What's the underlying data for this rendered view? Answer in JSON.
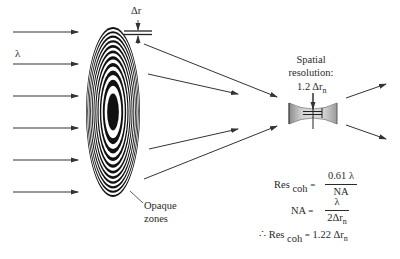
{
  "diagram": {
    "wavelength_label": "λ",
    "delta_r_label": "Δr",
    "opaque_zones_label": [
      "Opaque",
      "zones"
    ],
    "spatial_resolution": {
      "line1": "Spatial",
      "line2": "resolution:",
      "value_prefix": "1.2 Δr",
      "value_sub": "n"
    },
    "formulas": {
      "res_coh": {
        "lhs": "Res",
        "lhs_sub": "coh",
        "eq": "=",
        "numerator": "0.61 λ",
        "denominator": "NA"
      },
      "na": {
        "lhs": "NA",
        "eq": "=",
        "numerator": "λ",
        "denominator_prefix": "2Δr",
        "denominator_sub": "n"
      },
      "result": {
        "therefore": "∴",
        "lhs": "Res",
        "lhs_sub": "coh",
        "eq": "=",
        "rhs_prefix": "1.22 Δr",
        "rhs_sub": "n"
      }
    },
    "zone_plate": {
      "cx": 113,
      "cy": 112,
      "rx_outer": 27,
      "ry_outer": 85,
      "zones": 21,
      "fill_dark": "#111111",
      "fill_light": "#ffffff"
    },
    "colors": {
      "line": "#333333",
      "focus_fill": "#bdbdbd",
      "text": "#2a2a2a"
    },
    "incident_arrows_y": [
      32,
      64,
      96,
      128,
      160,
      192
    ],
    "converging_arrows": [
      {
        "x1": 144,
        "y1": 44,
        "x2": 277,
        "y2": 97
      },
      {
        "x1": 148,
        "y1": 74,
        "x2": 238,
        "y2": 94
      },
      {
        "x1": 149,
        "y1": 149,
        "x2": 238,
        "y2": 129
      },
      {
        "x1": 144,
        "y1": 179,
        "x2": 277,
        "y2": 126
      }
    ],
    "diverging_arrows": [
      {
        "x1": 346,
        "y1": 98,
        "x2": 386,
        "y2": 84
      },
      {
        "x1": 346,
        "y1": 125,
        "x2": 386,
        "y2": 139
      }
    ]
  }
}
